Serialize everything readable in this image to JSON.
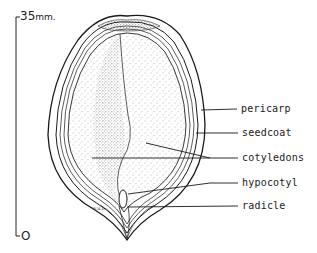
{
  "figure": {
    "type": "botanical cross-section illustration",
    "scale": {
      "top_value": "35",
      "top_unit": "mm.",
      "bottom_value": "O"
    },
    "labels": [
      {
        "text": "pericarp"
      },
      {
        "text": "seedcoat"
      },
      {
        "text": "cotyledons"
      },
      {
        "text": "hypocotyl"
      },
      {
        "text": "radicle"
      }
    ],
    "artist_initials": "w.u.l.",
    "colors": {
      "ink": "#1a1a1a",
      "background": "#ffffff",
      "stipple": "#555555"
    }
  }
}
